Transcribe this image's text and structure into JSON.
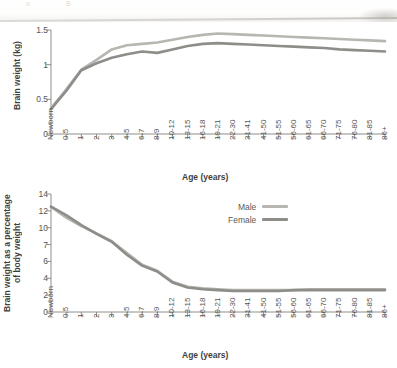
{
  "figure": {
    "ghost_text_left": "o",
    "ghost_text_right": "B"
  },
  "legend": {
    "position": "top-right of lower panel",
    "entries": [
      {
        "label": "Male",
        "color": "#b8b6b1"
      },
      {
        "label": "Female",
        "color": "#8e8d89"
      }
    ]
  },
  "axis": {
    "xlabel": "Age (years)",
    "categories": [
      "Newborn",
      "0.5",
      "1",
      "2",
      "3",
      "4-5",
      "6-7",
      "8-9",
      "10-12",
      "13-15",
      "16-18",
      "19-21",
      "22-30",
      "31-41",
      "41-50",
      "51-55",
      "56-60",
      "61-65",
      "66-70",
      "71-75",
      "76-80",
      "81-85",
      "86+"
    ]
  },
  "chart_data": [
    {
      "id": "brain-weight-kg",
      "type": "line",
      "title": "",
      "xlabel": "Age (years)",
      "ylabel": "Brain weight (kg)",
      "ylim": [
        0,
        1.5
      ],
      "yticks": [
        0,
        0.5,
        1,
        1.5
      ],
      "ytick_labels": [
        "0",
        "0.5",
        "1",
        "1.5"
      ],
      "grid": false,
      "legend": "none",
      "categories": [
        "Newborn",
        "0.5",
        "1",
        "2",
        "3",
        "4-5",
        "6-7",
        "8-9",
        "10-12",
        "13-15",
        "16-18",
        "19-21",
        "22-30",
        "31-41",
        "41-50",
        "51-55",
        "56-60",
        "61-65",
        "66-70",
        "71-75",
        "76-80",
        "81-85",
        "86+"
      ],
      "series": [
        {
          "name": "Male",
          "color": "#b8b6b1",
          "values": [
            0.37,
            0.64,
            0.93,
            1.07,
            1.22,
            1.28,
            1.3,
            1.32,
            1.36,
            1.4,
            1.43,
            1.45,
            1.44,
            1.43,
            1.42,
            1.41,
            1.4,
            1.39,
            1.38,
            1.37,
            1.36,
            1.35,
            1.34
          ]
        },
        {
          "name": "Female",
          "color": "#8e8d89",
          "values": [
            0.36,
            0.62,
            0.92,
            1.02,
            1.1,
            1.15,
            1.19,
            1.17,
            1.22,
            1.27,
            1.3,
            1.31,
            1.3,
            1.29,
            1.28,
            1.27,
            1.26,
            1.25,
            1.24,
            1.22,
            1.21,
            1.2,
            1.19
          ]
        }
      ]
    },
    {
      "id": "brain-weight-percent-body-weight",
      "type": "line",
      "title": "",
      "xlabel": "Age (years)",
      "ylabel": "Brain weight as a percentage of body weight",
      "ylim": [
        0,
        14
      ],
      "yticks": [
        0,
        2,
        4,
        6,
        7,
        10,
        12,
        14
      ],
      "ytick_labels": [
        "0",
        "2",
        "4",
        "6",
        "7",
        "10",
        "12",
        "14"
      ],
      "grid": false,
      "legend": "upper right",
      "categories": [
        "Newborn",
        "0.5",
        "1",
        "2",
        "3",
        "4-5",
        "6-7",
        "8-9",
        "10-12",
        "13-15",
        "16-18",
        "19-21",
        "22-30",
        "31-41",
        "41-50",
        "51-55",
        "56-60",
        "61-65",
        "66-70",
        "71-75",
        "76-80",
        "81-85",
        "86+"
      ],
      "series": [
        {
          "name": "Male",
          "color": "#b8b6b1",
          "values": [
            12.5,
            11.2,
            10.2,
            9.0,
            7.6,
            6.5,
            5.6,
            4.9,
            3.6,
            3.0,
            2.8,
            2.7,
            2.6,
            2.6,
            2.6,
            2.6,
            2.6,
            2.7,
            2.7,
            2.7,
            2.7,
            2.7,
            2.7
          ]
        },
        {
          "name": "Female",
          "color": "#8e8d89",
          "values": [
            12.5,
            11.5,
            10.3,
            8.9,
            7.5,
            6.4,
            5.5,
            4.8,
            3.5,
            2.9,
            2.7,
            2.6,
            2.5,
            2.5,
            2.5,
            2.5,
            2.6,
            2.6,
            2.6,
            2.6,
            2.6,
            2.6,
            2.6
          ]
        }
      ]
    }
  ]
}
